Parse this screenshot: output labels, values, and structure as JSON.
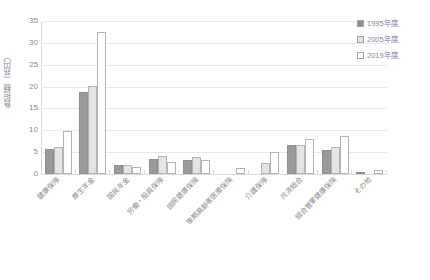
{
  "chart_data": {
    "type": "bar",
    "title": "",
    "xlabel": "",
    "ylabel": "負担額（兆円）",
    "ylim": [
      0,
      35
    ],
    "yticks": [
      0,
      5,
      10,
      15,
      20,
      25,
      30,
      35
    ],
    "ytick_labels": [
      "0",
      "5",
      "10",
      "15",
      "20",
      "25",
      "30",
      "35"
    ],
    "grid": true,
    "legend_position": "top-right",
    "categories": [
      "健康保険",
      "厚生年金",
      "国民年金",
      "労働・船員保険",
      "国民健康保険",
      "後期高齢者医療保険",
      "介護保険",
      "共済組合",
      "組合管掌健康保険",
      "その他"
    ],
    "series": [
      {
        "name": "1995年度",
        "color": "#9a9a9a",
        "values": [
          5.8,
          18.8,
          2.0,
          3.5,
          3.2,
          0.0,
          0.0,
          6.7,
          5.6,
          0.3
        ]
      },
      {
        "name": "2005年度",
        "color": "#e4e4e4",
        "values": [
          6.2,
          20.2,
          2.1,
          4.1,
          3.8,
          0.0,
          2.6,
          6.6,
          6.1,
          0.0
        ]
      },
      {
        "name": "2019年度",
        "color": "#ffffff",
        "values": [
          9.8,
          32.5,
          1.5,
          2.7,
          3.2,
          1.4,
          5.0,
          7.9,
          8.6,
          1.0
        ]
      }
    ]
  },
  "legend": {
    "items": [
      {
        "label": "1995年度"
      },
      {
        "label": "2005年度"
      },
      {
        "label": "2019年度"
      }
    ]
  },
  "axes": {
    "y_title": "負担額（兆円）"
  }
}
